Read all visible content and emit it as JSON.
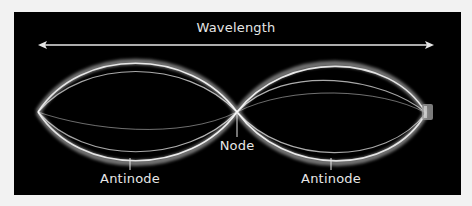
{
  "diagram": {
    "labels": {
      "wavelength": "Wavelength",
      "node": "Node",
      "antinode_left": "Antinode",
      "antinode_right": "Antinode"
    },
    "colors": {
      "background": "#000000",
      "page": "#f2f2f2",
      "line": "#e6e6e6"
    }
  }
}
